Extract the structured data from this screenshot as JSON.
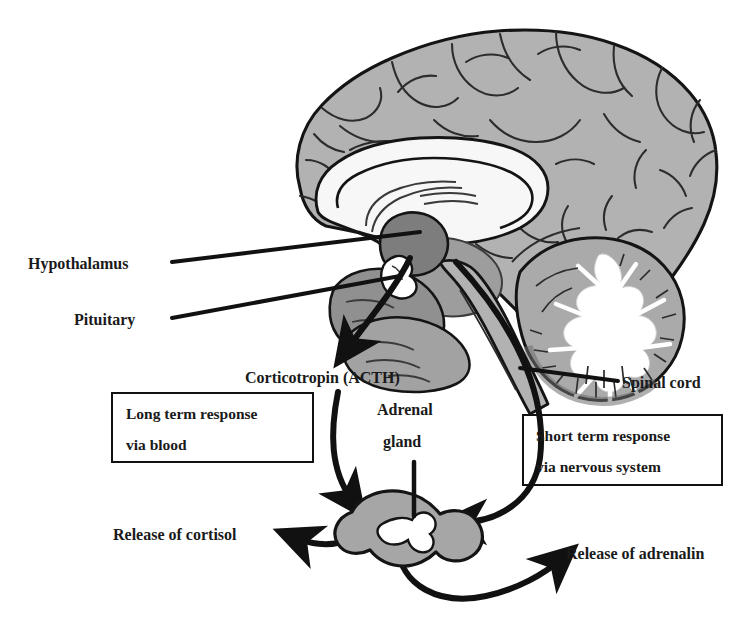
{
  "diagram": {
    "palette": {
      "cortex_gray": "#b2b2b2",
      "deep_gray": "#8f8f8f",
      "dark_gray": "#7d7d7d",
      "white_matter": "#ffffff",
      "outline": "#141414",
      "arrow": "#111111",
      "text": "#1a1a1a",
      "background": "#ffffff"
    },
    "labels": {
      "hypothalamus": "Hypothalamus",
      "pituitary": "Pituitary",
      "corticotropin": "Corticotropin (ACTH)",
      "adrenal_gland_line1": "Adrenal",
      "adrenal_gland_line2": "gland",
      "spinal_cord": "Spinal cord",
      "release_cortisol": "Release of cortisol",
      "release_adrenalin": "Release of adrenalin"
    },
    "boxes": [
      {
        "id": "long-term",
        "line1": "Long term response",
        "line2": "via blood"
      },
      {
        "id": "short-term",
        "line1": "Short term response",
        "line2": "via nervous system"
      }
    ],
    "structures": [
      "cerebral cortex",
      "corpus callosum",
      "hypothalamus",
      "pituitary gland",
      "brainstem",
      "cerebellum",
      "spinal cord",
      "adrenal gland"
    ],
    "pathways": [
      {
        "from": "pituitary",
        "to": "adrenal gland",
        "signal": "Corticotropin (ACTH)",
        "route": "blood",
        "speed": "long term"
      },
      {
        "from": "spinal cord",
        "to": "adrenal gland",
        "signal": "nerve impulse",
        "route": "nervous system",
        "speed": "short term"
      },
      {
        "from": "adrenal gland",
        "to": "body",
        "signal": "Release of cortisol"
      },
      {
        "from": "adrenal gland",
        "to": "body",
        "signal": "Release of adrenalin"
      }
    ]
  }
}
